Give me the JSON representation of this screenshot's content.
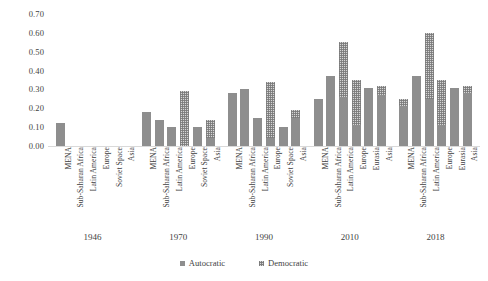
{
  "chart_data": {
    "type": "bar",
    "title": "",
    "subtitle": "",
    "xlabel": "",
    "ylabel": "",
    "ylim": [
      0.0,
      0.7
    ],
    "ytick_labels": [
      "0.00",
      "0.10",
      "0.20",
      "0.30",
      "0.40",
      "0.50",
      "0.60",
      "0.70"
    ],
    "ytick_values": [
      0.0,
      0.1,
      0.2,
      0.3,
      0.4,
      0.5,
      0.6,
      0.7
    ],
    "grid": false,
    "legend_position": "bottom-center",
    "legend": [
      {
        "name": "Autocratic",
        "style": "solid-gray",
        "color": "#8e8e8e"
      },
      {
        "name": "Democratic",
        "style": "hatched-light",
        "color": "#d6d6d6"
      }
    ],
    "group_label_name": "year",
    "groups": [
      {
        "year": "1946",
        "categories": [
          "MENA",
          "Sub-Saharan Africa",
          "Latin America",
          "Europe",
          "Soviet Space",
          "Asia"
        ],
        "series": [
          {
            "name": "Autocratic",
            "values": [
              0.12,
              0.0,
              0.0,
              0.0,
              0.0,
              0.0
            ]
          },
          {
            "name": "Democratic",
            "values": [
              0.0,
              0.0,
              0.0,
              0.0,
              0.0,
              0.0
            ]
          }
        ]
      },
      {
        "year": "1970",
        "categories": [
          "MENA",
          "Sub-Saharan Africa",
          "Latin America",
          "Europe",
          "Soviet Space",
          "Asia"
        ],
        "series": [
          {
            "name": "Autocratic",
            "values": [
              0.18,
              0.14,
              0.1,
              0.0,
              0.1,
              0.04
            ]
          },
          {
            "name": "Democratic",
            "values": [
              0.0,
              0.0,
              0.0,
              0.29,
              0.0,
              0.14
            ]
          }
        ]
      },
      {
        "year": "1990",
        "categories": [
          "MENA",
          "Sub-Saharan Africa",
          "Latin America",
          "Europe",
          "Soviet Space",
          "Asia"
        ],
        "series": [
          {
            "name": "Autocratic",
            "values": [
              0.28,
              0.3,
              0.15,
              0.04,
              0.1,
              0.15
            ]
          },
          {
            "name": "Democratic",
            "values": [
              0.0,
              0.0,
              0.0,
              0.34,
              0.0,
              0.19
            ]
          }
        ]
      },
      {
        "year": "2010",
        "categories": [
          "MENA",
          "Sub-Saharan Africa",
          "Latin America",
          "Europe",
          "Eurasia",
          "Asia"
        ],
        "series": [
          {
            "name": "Autocratic",
            "values": [
              0.25,
              0.37,
              0.26,
              0.11,
              0.31,
              0.27
            ]
          },
          {
            "name": "Democratic",
            "values": [
              0.0,
              0.0,
              0.55,
              0.35,
              0.0,
              0.32
            ]
          }
        ]
      },
      {
        "year": "2018",
        "categories": [
          "MENA",
          "Sub-Saharan Africa",
          "Latin America",
          "Europe",
          "Eurasia",
          "Asia"
        ],
        "series": [
          {
            "name": "Autocratic",
            "values": [
              0.21,
              0.37,
              0.25,
              0.11,
              0.31,
              0.28
            ]
          },
          {
            "name": "Democratic",
            "values": [
              0.25,
              0.0,
              0.6,
              0.35,
              0.0,
              0.32
            ]
          }
        ]
      }
    ]
  }
}
